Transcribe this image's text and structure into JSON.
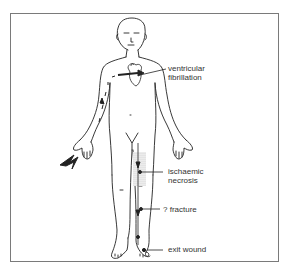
{
  "diagram": {
    "type": "anatomical-figure",
    "labels": {
      "ventricular_fibrillation_1": "ventricular",
      "ventricular_fibrillation_2": "fibrillation",
      "ischaemic_necrosis_1": "ischaemic",
      "ischaemic_necrosis_2": "necrosis",
      "fracture": "? fracture",
      "exit_wound": "exit wound"
    },
    "icons": {
      "entry": "lightning-bolt-icon"
    },
    "colors": {
      "line": "#222222",
      "frame": "#7a7a7a",
      "text": "#333333",
      "shading": "#bdbdbd"
    }
  }
}
